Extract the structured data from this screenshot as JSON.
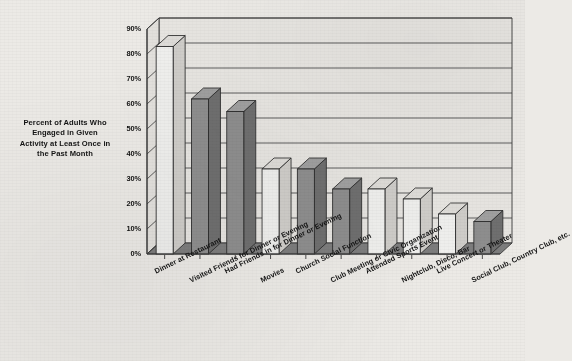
{
  "chart_data": {
    "type": "bar",
    "title": "",
    "xlabel": "",
    "ylabel": "Percent of Adults Who Engaged in Given Activity at Least Once in the Past Month",
    "ylim": [
      0,
      90
    ],
    "ytick_step": 10,
    "grid": true,
    "legend": "none",
    "categories": [
      "Dinner at  Restaurant",
      "Visited Friends for Dinner or Evening",
      "Had Friends in for Dinner or Evening",
      "Movies",
      "Church Social Function",
      "Club Meeting or Civic Organization",
      "Attended Sports Event",
      "Nightclub, Disco, Bar",
      "Live Concert or Theater",
      "Social Club, Country Club, etc."
    ],
    "values": [
      83,
      62,
      57,
      34,
      34,
      26,
      26,
      22,
      16,
      13
    ],
    "ytick_labels": [
      "0%",
      "10%",
      "20%",
      "30%",
      "40%",
      "50%",
      "60%",
      "70%",
      "80%",
      "90%"
    ],
    "bar_fills": [
      "light",
      "dark",
      "dark",
      "light",
      "dark",
      "dark",
      "light",
      "light",
      "light",
      "dark"
    ]
  },
  "colors": {
    "bar_light": "#efefed",
    "bar_dark": "#8e8e8e",
    "bar_outline": "#2a2a2a",
    "floor": "#7d7d7d",
    "back_wall": "#e7e5e1",
    "gridline": "#3a3a3a",
    "text": "#141414",
    "page_background": "#eceae6"
  },
  "axis": {
    "y_title": "Percent of Adults Who Engaged in Given Activity at Least Once in the Past Month",
    "y_title_lines": [
      "Percent of Adults Who",
      "Engaged in Given",
      "Activity at Least Once in",
      "the Past Month"
    ]
  }
}
